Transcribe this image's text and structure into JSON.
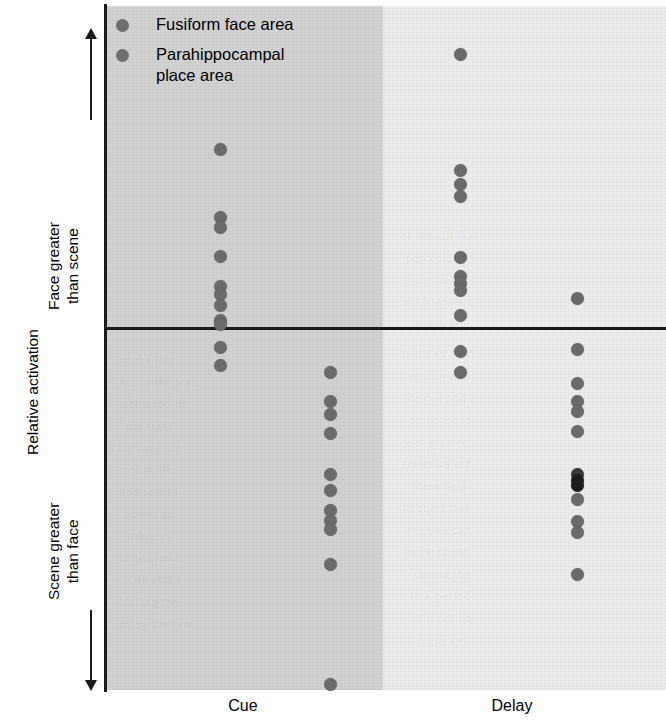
{
  "figure": {
    "background": "#ffffff",
    "panel_cue_color": "#d2d2d2",
    "panel_delay_color": "#ededed",
    "dot_color": "#6a6a6a",
    "axis_color": "#1a1a1a"
  },
  "axes": {
    "y_label": "Relative activation",
    "y_upper_line1": "Face greater",
    "y_upper_line2": "than scene",
    "y_lower_line1": "Scene greater",
    "y_lower_line2": "than face",
    "y_up_arrow": "up-arrow-icon",
    "y_down_arrow": "down-arrow-icon",
    "zero_line": "horizontal-zero-line"
  },
  "legend": {
    "items": [
      {
        "label": "Fusiform face area",
        "marker": "gray-dot-marker",
        "series": "FFA"
      },
      {
        "label": "Parahippocampal\nplace area",
        "label_line1": "Parahippocampal",
        "label_line2": "place area",
        "marker": "gray-dot-marker",
        "series": "PPA"
      }
    ]
  },
  "x_categories": [
    {
      "label": "Cue",
      "panel": "cue"
    },
    {
      "label": "Delay",
      "panel": "delay"
    }
  ],
  "chart_data": {
    "type": "scatter",
    "title": "",
    "subtitle": "",
    "xlabel": "",
    "ylabel": "Relative activation",
    "grid": false,
    "legend_position": "top-left-inside",
    "annotations": [
      "Face greater than scene",
      "Scene greater than face"
    ],
    "y_axis": {
      "description": "Relative activation; positive = face greater than scene, negative = scene greater than face",
      "zero_reference": 0,
      "ylim": [
        -1.0,
        1.0
      ],
      "ticks_shown": false
    },
    "x_axis": {
      "categories": [
        "Cue",
        "Delay"
      ],
      "groups_per_category": [
        "Fusiform face area",
        "Parahippocampal place area"
      ]
    },
    "series": [
      {
        "name": "Fusiform face area",
        "color": "#6a6a6a",
        "points": [
          {
            "x_category": "Cue",
            "x_pos": 220,
            "values": [
              0.5,
              0.308,
              0.282,
              0.2,
              0.116,
              0.093,
              0.064,
              0.022,
              0.01,
              -0.055,
              -0.105
            ]
          },
          {
            "x_category": "Delay",
            "x_pos": 460,
            "values": [
              0.765,
              0.44,
              0.4,
              0.367,
              0.197,
              0.145,
              0.123,
              0.105,
              0.035,
              -0.065,
              -0.123
            ]
          }
        ]
      },
      {
        "name": "Parahippocampal place area",
        "color": "#6a6a6a",
        "points": [
          {
            "x_category": "Cue",
            "x_pos": 330,
            "values": [
              -0.125,
              -0.205,
              -0.243,
              -0.295,
              -0.41,
              -0.453,
              -0.51,
              -0.537,
              -0.562,
              -0.66,
              -0.995
            ]
          },
          {
            "x_category": "Delay",
            "x_pos": 577,
            "values": [
              0.083,
              -0.06,
              -0.155,
              -0.205,
              -0.233,
              -0.29,
              -0.41,
              -0.425,
              -0.44,
              -0.478,
              -0.54,
              -0.57,
              -0.688
            ]
          }
        ]
      }
    ]
  },
  "ghost_text": [
    {
      "t": "of stimuli that",
      "x": 400,
      "y": 228
    },
    {
      "t": "perceptual",
      "x": 406,
      "y": 250
    },
    {
      "t": "is activation",
      "x": 400,
      "y": 272
    },
    {
      "t": "maintenance",
      "x": 404,
      "y": 294
    },
    {
      "t": "the delay",
      "x": 416,
      "y": 316
    },
    {
      "t": "memory load",
      "x": 402,
      "y": 345
    },
    {
      "t": "attention to",
      "x": 408,
      "y": 368
    },
    {
      "t": "the cue and",
      "x": 404,
      "y": 390
    },
    {
      "t": "response in",
      "x": 410,
      "y": 412
    },
    {
      "t": "was greater",
      "x": 404,
      "y": 434
    },
    {
      "t": "selective for",
      "x": 402,
      "y": 456
    },
    {
      "t": "these data",
      "x": 412,
      "y": 478
    },
    {
      "t": "suggest that",
      "x": 404,
      "y": 500
    },
    {
      "t": "regions can",
      "x": 408,
      "y": 522
    },
    {
      "t": "be recruited",
      "x": 404,
      "y": 544
    },
    {
      "t": "during the",
      "x": 414,
      "y": 566
    },
    {
      "t": "task period",
      "x": 410,
      "y": 588
    },
    {
      "t": "of working",
      "x": 412,
      "y": 610
    },
    {
      "t": "memory",
      "x": 418,
      "y": 632
    },
    {
      "t": "in the left",
      "x": 120,
      "y": 352
    },
    {
      "t": "activation was",
      "x": 118,
      "y": 374
    },
    {
      "t": "observed in",
      "x": 122,
      "y": 396
    },
    {
      "t": "the right",
      "x": 126,
      "y": 418
    },
    {
      "t": "hemisphere",
      "x": 118,
      "y": 440
    },
    {
      "t": "for faces",
      "x": 124,
      "y": 462
    },
    {
      "t": "and scenes",
      "x": 120,
      "y": 484
    },
    {
      "t": "across all",
      "x": 124,
      "y": 506
    },
    {
      "t": "subjects",
      "x": 126,
      "y": 528
    },
    {
      "t": "tested here",
      "x": 120,
      "y": 550
    },
    {
      "t": "with fMRI",
      "x": 124,
      "y": 572
    },
    {
      "t": "during the",
      "x": 122,
      "y": 594
    },
    {
      "t": "delay interval",
      "x": 118,
      "y": 616
    }
  ]
}
